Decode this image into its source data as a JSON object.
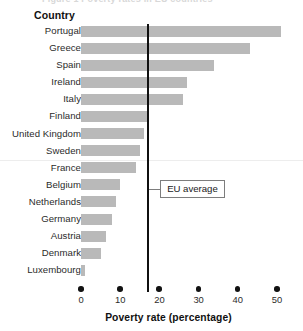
{
  "figure": {
    "cropped_caption_sliver": "Figure 1   Poverty rates in EU countries",
    "group_header": "Country",
    "xaxis_title": "Poverty rate (percentage)",
    "annotation_label": "EU average",
    "bar_color": "#b9b9b9",
    "reference_line_color": "#101010"
  },
  "chart_data": {
    "type": "bar",
    "orientation": "horizontal",
    "title": "",
    "xlabel": "Poverty rate (percentage)",
    "ylabel": "Country",
    "xlim": [
      0,
      53
    ],
    "xticks": [
      0,
      10,
      20,
      30,
      40,
      50
    ],
    "xtick_labels": [
      "0",
      "10",
      "20",
      "30",
      "40",
      "50"
    ],
    "grid": false,
    "legend": false,
    "categories": [
      "Portugal",
      "Greece",
      "Spain",
      "Ireland",
      "Italy",
      "Finland",
      "United Kingdom",
      "Sweden",
      "France",
      "Belgium",
      "Netherlands",
      "Germany",
      "Austria",
      "Denmark",
      "Luxembourg"
    ],
    "values": [
      51,
      43,
      34,
      27,
      26,
      17,
      16,
      15,
      14,
      10,
      9,
      8,
      6.5,
      5,
      1
    ],
    "annotations": [
      {
        "label": "EU average",
        "type": "vertical-reference-line",
        "value": 17
      }
    ]
  }
}
